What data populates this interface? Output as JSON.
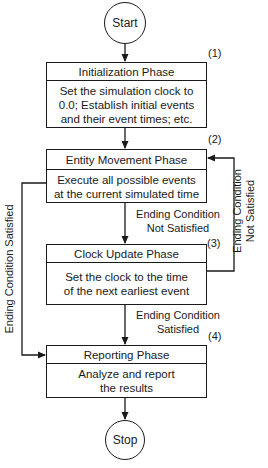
{
  "diagram": {
    "type": "flowchart",
    "start": "Start",
    "stop": "Stop",
    "phases": [
      {
        "number": "(1)",
        "title": "Initialization Phase",
        "description": [
          "Set the simulation clock to",
          "0.0; Establish initial events",
          "and their event times; etc."
        ]
      },
      {
        "number": "(2)",
        "title": "Entity Movement Phase",
        "description": [
          "Execute all possible events",
          "at the current simulated time"
        ]
      },
      {
        "number": "(3)",
        "title": "Clock Update Phase",
        "description": [
          "Set the clock to the time",
          "of the next earliest event"
        ]
      },
      {
        "number": "(4)",
        "title": "Reporting Phase",
        "description": [
          "Analyze and report",
          "the results"
        ]
      }
    ],
    "edges": {
      "phase2_to_phase3": [
        "Ending Condition",
        "Not Satisfied"
      ],
      "phase3_to_phase4": [
        "Ending Condition",
        "Satisfied"
      ],
      "phase3_loop_to_phase2": [
        "Ending Condition",
        "Not Satisfied"
      ],
      "phase2_to_phase4": "Ending Condition Satisfied"
    }
  }
}
